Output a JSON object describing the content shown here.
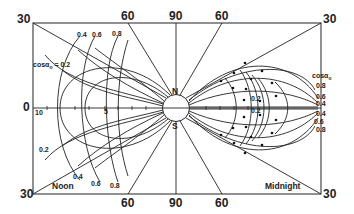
{
  "diagram": {
    "frame_labels": {
      "top_left": "30",
      "top_60_left": "60",
      "top_90": "90",
      "top_60_right": "60",
      "top_right": "30",
      "bottom_left": "30",
      "bottom_60_left": "60",
      "bottom_90": "90",
      "bottom_60_right": "60",
      "bottom_right": "30",
      "left_zero": "0"
    },
    "axis_ticks": {
      "outer": "10",
      "mid": "5"
    },
    "pole_labels": {
      "north": "N",
      "south": "S"
    },
    "corner_labels": {
      "noon": "Noon",
      "midnight": "Midnight"
    },
    "left_curves": {
      "legend": "cosα",
      "legend_sub": "o",
      "legend_value": "= 0.2",
      "top_labels": [
        "0.4",
        "0.6",
        "0.8"
      ],
      "bottom_labels": [
        "0.2",
        "0.4",
        "0.6",
        "0.8"
      ]
    },
    "right_curves": {
      "legend": "cosα",
      "legend_sub": "o",
      "labels": [
        "0.8",
        "0.6",
        "0.4",
        "0.4",
        "0.6",
        "0.8"
      ],
      "inner_labels": [
        "0.2",
        "0.2"
      ]
    },
    "colors": {
      "line": "#222222",
      "background": "#ffffff"
    }
  }
}
